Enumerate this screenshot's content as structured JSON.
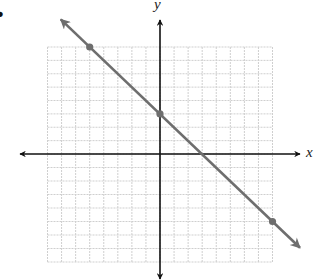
{
  "problem_marker": "•",
  "axes": {
    "x_label": "x",
    "y_label": "y",
    "axis_color": "#111111"
  },
  "grid": {
    "x_range": [
      -8,
      8
    ],
    "y_range": [
      -8,
      8
    ],
    "step": 1,
    "color": "#cfcfcf"
  },
  "line": {
    "color": "#6e6e6e",
    "equation": "y = -x + 3",
    "slope": -1,
    "y_intercept": 3,
    "x_intercept": 3,
    "points": [
      {
        "x": -5,
        "y": 8
      },
      {
        "x": 0,
        "y": 3
      },
      {
        "x": 8,
        "y": -5
      }
    ],
    "arrows_both_ends": true
  },
  "chart_data": {
    "type": "line",
    "title": "",
    "xlabel": "x",
    "ylabel": "y",
    "xlim": [
      -8,
      8
    ],
    "ylim": [
      -8,
      8
    ],
    "grid": true,
    "series": [
      {
        "name": "y = -x + 3",
        "x": [
          -5,
          0,
          8
        ],
        "y": [
          8,
          3,
          -5
        ]
      }
    ]
  }
}
